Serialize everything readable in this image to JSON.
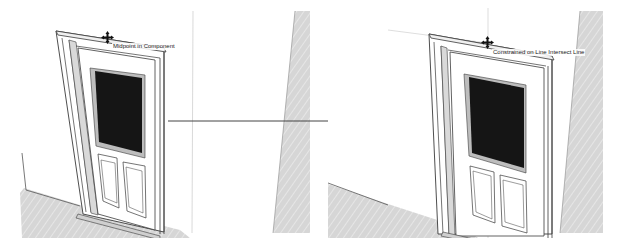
{
  "figure": {
    "panels": [
      {
        "id": "before",
        "tooltip": "Midpoint in Component",
        "cursor_icon": "move-cursor-icon"
      },
      {
        "id": "after",
        "tooltip": "Constrained on Line Intersect Line",
        "cursor_icon": "move-cursor-icon"
      }
    ],
    "arrow_icon": "right-arrow-icon"
  },
  "colors": {
    "background": "#ffffff",
    "outline": "#3a3a3a",
    "glass": "#151515",
    "floor_shade": "#d4d4d4",
    "wall_shade": "#dcdcdc",
    "guide_line": "#c8c8c8"
  }
}
